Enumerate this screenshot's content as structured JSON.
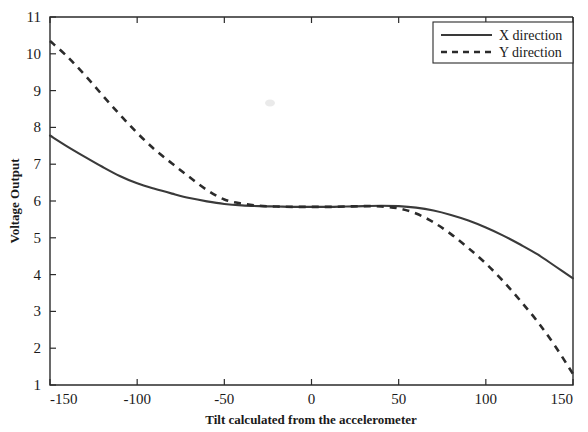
{
  "chart_data": {
    "type": "line",
    "title": "",
    "xlabel": "Tilt calculated from the accelerometer",
    "ylabel": "Voltage Output",
    "xlim": [
      -150,
      150
    ],
    "ylim": [
      1,
      11
    ],
    "xticks": [
      -150,
      -100,
      -50,
      0,
      50,
      100,
      150
    ],
    "xtick_labels": [
      "-150",
      "-100",
      "-50",
      "0",
      "50",
      "100",
      "150"
    ],
    "yticks": [
      1,
      2,
      3,
      4,
      5,
      6,
      7,
      8,
      9,
      10,
      11
    ],
    "ytick_labels": [
      "1",
      "2",
      "3",
      "4",
      "5",
      "6",
      "7",
      "8",
      "9",
      "10",
      "11"
    ],
    "grid": false,
    "legend_position": "top-right",
    "series": [
      {
        "name": "X direction",
        "style": "solid",
        "color": "#3a3a3a",
        "x": [
          -150,
          -140,
          -130,
          -120,
          -110,
          -100,
          -90,
          -80,
          -70,
          -60,
          -50,
          -40,
          -30,
          -20,
          -10,
          0,
          10,
          20,
          30,
          40,
          50,
          60,
          70,
          80,
          90,
          100,
          110,
          120,
          130,
          140,
          150
        ],
        "values": [
          7.78,
          7.48,
          7.2,
          6.93,
          6.68,
          6.48,
          6.33,
          6.2,
          6.08,
          5.99,
          5.92,
          5.88,
          5.86,
          5.85,
          5.84,
          5.84,
          5.84,
          5.85,
          5.86,
          5.87,
          5.86,
          5.82,
          5.74,
          5.62,
          5.47,
          5.28,
          5.06,
          4.81,
          4.54,
          4.22,
          3.9
        ]
      },
      {
        "name": "Y direction",
        "style": "dashed",
        "color": "#2b2b2b",
        "x": [
          -150,
          -140,
          -130,
          -120,
          -110,
          -100,
          -90,
          -80,
          -70,
          -60,
          -50,
          -40,
          -30,
          -20,
          -10,
          0,
          10,
          20,
          30,
          40,
          50,
          60,
          70,
          80,
          90,
          100,
          110,
          120,
          130,
          140,
          150
        ],
        "values": [
          10.35,
          9.92,
          9.42,
          8.88,
          8.35,
          7.85,
          7.4,
          7.02,
          6.65,
          6.3,
          6.04,
          5.93,
          5.87,
          5.85,
          5.84,
          5.84,
          5.84,
          5.85,
          5.86,
          5.85,
          5.8,
          5.66,
          5.42,
          5.1,
          4.72,
          4.3,
          3.82,
          3.28,
          2.7,
          2.04,
          1.3
        ]
      }
    ]
  },
  "legend": {
    "entries": [
      {
        "label": "X direction",
        "style": "solid"
      },
      {
        "label": "Y direction",
        "style": "dashed"
      }
    ]
  },
  "axes": {
    "y_axis_title": "Voltage Output",
    "x_axis_title": "Tilt calculated from the accelerometer"
  }
}
